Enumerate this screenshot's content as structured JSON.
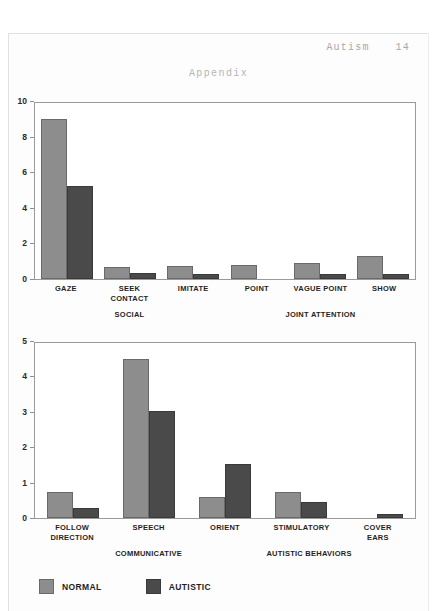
{
  "document": {
    "running_head": "Autism",
    "page_number": "14",
    "appendix_title": "Appendix"
  },
  "legend": {
    "items": [
      {
        "label": "NORMAL",
        "color": "#8d8d8d",
        "key": "normal"
      },
      {
        "label": "AUTISTIC",
        "color": "#4a4a4a",
        "key": "autistic"
      }
    ]
  },
  "chart_data": [
    {
      "id": "chart-1",
      "type": "bar",
      "title": "",
      "xlabel": "",
      "ylabel": "",
      "ylim": [
        0,
        10
      ],
      "yticks": [
        0,
        2,
        4,
        6,
        8,
        10
      ],
      "ytick_labels": [
        "0",
        "2",
        "4",
        "6",
        "8",
        "10"
      ],
      "grid": false,
      "legend_position": "bottom-left",
      "categories": [
        "GAZE",
        "SEEK CONTACT",
        "IMITATE",
        "POINT",
        "VAGUE POINT",
        "SHOW"
      ],
      "category_lines": [
        [
          "GAZE"
        ],
        [
          "SEEK",
          "CONTACT"
        ],
        [
          "IMITATE"
        ],
        [
          "POINT"
        ],
        [
          "VAGUE POINT"
        ],
        [
          "SHOW"
        ]
      ],
      "series": [
        {
          "name": "NORMAL",
          "color": "#8d8d8d",
          "values": [
            9.1,
            0.7,
            0.75,
            0.8,
            0.9,
            1.3
          ]
        },
        {
          "name": "AUTISTIC",
          "color": "#4a4a4a",
          "values": [
            5.3,
            0.35,
            0.3,
            0.0,
            0.3,
            0.3
          ]
        }
      ],
      "group_labels": [
        {
          "text": "SOCIAL",
          "center_pct": 25
        },
        {
          "text": "JOINT ATTENTION",
          "center_pct": 75
        }
      ]
    },
    {
      "id": "chart-2",
      "type": "bar",
      "title": "",
      "xlabel": "",
      "ylabel": "",
      "ylim": [
        0,
        5
      ],
      "yticks": [
        0,
        1,
        2,
        3,
        4,
        5
      ],
      "ytick_labels": [
        "0",
        "1",
        "2",
        "3",
        "4",
        "5"
      ],
      "grid": false,
      "legend_position": "bottom-left",
      "categories": [
        "FOLLOW DIRECTION",
        "SPEECH",
        "ORIENT",
        "STIMULATORY",
        "COVER EARS"
      ],
      "category_lines": [
        [
          "FOLLOW",
          "DIRECTION"
        ],
        [
          "SPEECH"
        ],
        [
          "ORIENT"
        ],
        [
          "STIMULATORY"
        ],
        [
          "COVER",
          "EARS"
        ]
      ],
      "series": [
        {
          "name": "NORMAL",
          "color": "#8d8d8d",
          "values": [
            0.75,
            4.55,
            0.6,
            0.75,
            0.0
          ]
        },
        {
          "name": "AUTISTIC",
          "color": "#4a4a4a",
          "values": [
            0.3,
            3.05,
            1.55,
            0.45,
            0.12
          ]
        }
      ],
      "group_labels": [
        {
          "text": "COMMUNICATIVE",
          "center_pct": 30
        },
        {
          "text": "AUTISTIC BEHAVIORS",
          "center_pct": 72
        }
      ]
    }
  ]
}
